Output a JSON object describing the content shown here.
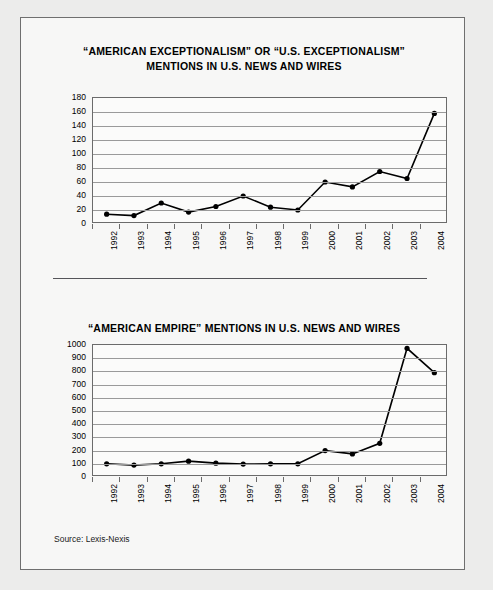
{
  "frame": {
    "source_note": "Source: Lexis-Nexis",
    "border_color": "#6f6f6f",
    "background": "#f7f7f6"
  },
  "chart_data": [
    {
      "type": "line",
      "id": "exceptionalism",
      "title": "“AMERICAN EXCEPTIONALISM” OR “U.S. EXCEPTIONALISM” MENTIONS IN U.S.  NEWS AND WIRES",
      "title_line1": "“AMERICAN EXCEPTIONALISM” OR “U.S. EXCEPTIONALISM”",
      "title_line2": "MENTIONS IN U.S.  NEWS AND WIRES",
      "xlabel": "",
      "ylabel": "",
      "categories": [
        "1992",
        "1993",
        "1994",
        "1995",
        "1996",
        "1997",
        "1998",
        "1999",
        "2000",
        "2001",
        "2002",
        "2003",
        "2004"
      ],
      "values": [
        14,
        12,
        30,
        17,
        25,
        40,
        24,
        20,
        60,
        53,
        75,
        65,
        158
      ],
      "ylim": [
        0,
        180
      ],
      "yticks": [
        0,
        20,
        40,
        60,
        80,
        100,
        120,
        140,
        160,
        180
      ],
      "grid": true,
      "legend": "none",
      "line_color": "#000000",
      "marker": "circle"
    },
    {
      "type": "line",
      "id": "empire",
      "title": "“AMERICAN EMPIRE”  MENTIONS IN U.S. NEWS AND WIRES",
      "title_line1": "“AMERICAN EMPIRE”  MENTIONS IN U.S. NEWS AND WIRES",
      "title_line2": "",
      "xlabel": "",
      "ylabel": "",
      "categories": [
        "1992",
        "1993",
        "1994",
        "1995",
        "1996",
        "1997",
        "1998",
        "1999",
        "2000",
        "2001",
        "2002",
        "2003",
        "2004"
      ],
      "values": [
        100,
        90,
        100,
        120,
        105,
        98,
        100,
        100,
        200,
        175,
        255,
        975,
        790
      ],
      "ylim": [
        0,
        1000
      ],
      "yticks": [
        0,
        100,
        200,
        300,
        400,
        500,
        600,
        700,
        800,
        900,
        1000
      ],
      "grid": true,
      "legend": "none",
      "line_color": "#000000",
      "marker": "circle"
    }
  ]
}
